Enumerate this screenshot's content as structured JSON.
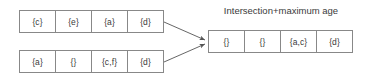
{
  "diagram": {
    "title": "Intersection+maximum age",
    "colors": {
      "background": "#ffffff",
      "border": "#888888",
      "text": "#3a3a3a",
      "arrow": "#555555"
    },
    "inputs": [
      {
        "name": "top-vector",
        "cells": [
          "{c}",
          "{e}",
          "{a}",
          "{d}"
        ]
      },
      {
        "name": "bottom-vector",
        "cells": [
          "{a}",
          "{}",
          "{c,f}",
          "{d}"
        ]
      }
    ],
    "output": {
      "name": "result-vector",
      "cells": [
        "{}",
        "{}",
        "{a,c}",
        "{d}"
      ]
    },
    "arrows": [
      {
        "name": "arrow-from-top-vector",
        "from": "top-vector",
        "to": "result-vector"
      },
      {
        "name": "arrow-from-bottom-vector",
        "from": "bottom-vector",
        "to": "result-vector"
      }
    ]
  }
}
